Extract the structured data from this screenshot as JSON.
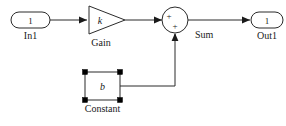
{
  "diagram": {
    "background_color": "#ffffff",
    "line_color": "#2b2b2b",
    "text_color": "#1a1a1a",
    "selection_handle_color": "#000000",
    "blocks": {
      "inport": {
        "label": "In1",
        "port_number": "1",
        "icon": "inport-rounded-rect"
      },
      "gain": {
        "label": "Gain",
        "parameter": "k",
        "icon": "gain-triangle"
      },
      "sum": {
        "label": "Sum",
        "icon": "sum-circle",
        "sign_left": "+",
        "sign_bottom": "+"
      },
      "outport": {
        "label": "Out1",
        "port_number": "1",
        "icon": "outport-rounded-rect"
      },
      "constant": {
        "label": "Constant",
        "parameter": "b",
        "icon": "constant-square",
        "selected": "true"
      }
    },
    "signals": {
      "in1_to_gain": "In1 to Gain",
      "gain_to_sum": "Gain to Sum",
      "sum_to_out1": "Sum to Out1",
      "constant_to_sum": "Constant to Sum"
    }
  }
}
